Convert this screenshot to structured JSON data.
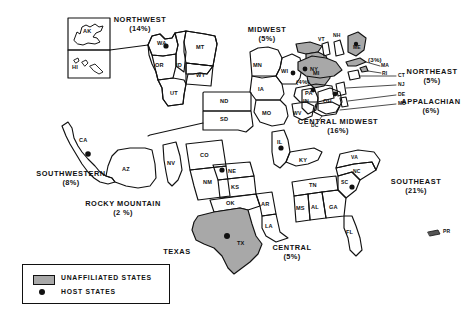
{
  "figure": {
    "type": "map"
  },
  "legend": {
    "items": [
      {
        "symbol": "gray-swatch",
        "label": "UNAFFILIATED STATES"
      },
      {
        "symbol": "black-dot",
        "label": "HOST STATES"
      }
    ]
  },
  "regions": [
    {
      "id": "northwest",
      "name": "NORTHWEST",
      "pct": "(14%)"
    },
    {
      "id": "midwest",
      "name": "MIDWEST",
      "pct": "(5%)"
    },
    {
      "id": "northeast",
      "name": "NORTHEAST",
      "pct": "(5%)"
    },
    {
      "id": "appalachian",
      "name": "APPALACHIAN",
      "pct": "(6%)"
    },
    {
      "id": "central-midwest",
      "name": "CENTRAL  MIDWEST",
      "pct": "(16%)"
    },
    {
      "id": "southeast",
      "name": "SOUTHEAST",
      "pct": "(21%)"
    },
    {
      "id": "southwestern",
      "name": "SOUTHWESTERN",
      "pct": "(8%)"
    },
    {
      "id": "rocky-mountain",
      "name": "ROCKY  MOUNTAIN",
      "pct": "(2 %)"
    },
    {
      "id": "texas",
      "name": "TEXAS",
      "pct": ""
    },
    {
      "id": "central",
      "name": "CENTRAL",
      "pct": "(5%)"
    }
  ],
  "inline_pcts": [
    {
      "id": "maine-pct",
      "text": "(3%)"
    },
    {
      "id": "newyork-pct",
      "text": "(4%)"
    }
  ],
  "states": [
    {
      "abbr": "AK"
    },
    {
      "abbr": "HI"
    },
    {
      "abbr": "WA"
    },
    {
      "abbr": "OR"
    },
    {
      "abbr": "ID"
    },
    {
      "abbr": "MT"
    },
    {
      "abbr": "WY"
    },
    {
      "abbr": "UT"
    },
    {
      "abbr": "ND"
    },
    {
      "abbr": "SD"
    },
    {
      "abbr": "CA"
    },
    {
      "abbr": "AZ"
    },
    {
      "abbr": "NV"
    },
    {
      "abbr": "CO"
    },
    {
      "abbr": "NM"
    },
    {
      "abbr": "MN"
    },
    {
      "abbr": "WI"
    },
    {
      "abbr": "MI"
    },
    {
      "abbr": "IA"
    },
    {
      "abbr": "MO"
    },
    {
      "abbr": "IN"
    },
    {
      "abbr": "OH"
    },
    {
      "abbr": "IL"
    },
    {
      "abbr": "KY"
    },
    {
      "abbr": "NE"
    },
    {
      "abbr": "KS"
    },
    {
      "abbr": "OK"
    },
    {
      "abbr": "AR"
    },
    {
      "abbr": "LA"
    },
    {
      "abbr": "TX"
    },
    {
      "abbr": "MS"
    },
    {
      "abbr": "AL"
    },
    {
      "abbr": "GA"
    },
    {
      "abbr": "FL"
    },
    {
      "abbr": "TN"
    },
    {
      "abbr": "SC"
    },
    {
      "abbr": "NC"
    },
    {
      "abbr": "VA"
    },
    {
      "abbr": "WV"
    },
    {
      "abbr": "PA"
    },
    {
      "abbr": "NY"
    },
    {
      "abbr": "VT"
    },
    {
      "abbr": "NH"
    },
    {
      "abbr": "ME"
    },
    {
      "abbr": "MA"
    },
    {
      "abbr": "RI"
    },
    {
      "abbr": "CT"
    },
    {
      "abbr": "NJ"
    },
    {
      "abbr": "DE"
    },
    {
      "abbr": "MD"
    },
    {
      "abbr": "DC"
    },
    {
      "abbr": "PR"
    }
  ],
  "unaffiliated_states": [
    "MI",
    "ME",
    "NY",
    "MA",
    "RI",
    "TX"
  ],
  "host_states": [
    "WA",
    "CA",
    "WI",
    "OH",
    "IL",
    "NE",
    "PA",
    "TX",
    "SC"
  ],
  "colors": {
    "ink": "#111111",
    "unaffiliated_fill": "#a8a8a8",
    "background": "#ffffff"
  }
}
